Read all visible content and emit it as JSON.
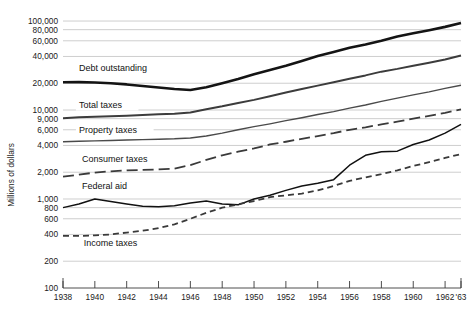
{
  "chart_data": {
    "type": "line",
    "title": "",
    "xlabel": "",
    "ylabel": "Millions of dollars",
    "yscale": "log",
    "ylim": [
      100,
      120000
    ],
    "xlim": [
      1938,
      1963
    ],
    "grid": true,
    "legend_position": "inline-labels",
    "y_ticks": [
      {
        "value": 100,
        "label": "100"
      },
      {
        "value": 200,
        "label": "200"
      },
      {
        "value": 400,
        "label": "400"
      },
      {
        "value": 600,
        "label": "600"
      },
      {
        "value": 800,
        "label": "800"
      },
      {
        "value": 1000,
        "label": "1,000"
      },
      {
        "value": 2000,
        "label": "2,000"
      },
      {
        "value": 4000,
        "label": "4,000"
      },
      {
        "value": 6000,
        "label": "6,000"
      },
      {
        "value": 8000,
        "label": "9,000"
      },
      {
        "value": 10000,
        "label": "10,000"
      },
      {
        "value": 20000,
        "label": "20,000"
      },
      {
        "value": 40000,
        "label": "40,000"
      },
      {
        "value": 60000,
        "label": "60,000"
      },
      {
        "value": 80000,
        "label": "80,000"
      },
      {
        "value": 100000,
        "label": "100,000"
      }
    ],
    "x_ticks": [
      {
        "value": 1938,
        "label": "1938"
      },
      {
        "value": 1940,
        "label": "1940"
      },
      {
        "value": 1942,
        "label": "1942"
      },
      {
        "value": 1944,
        "label": "1944"
      },
      {
        "value": 1946,
        "label": "1946"
      },
      {
        "value": 1948,
        "label": "1948"
      },
      {
        "value": 1950,
        "label": "1950"
      },
      {
        "value": 1952,
        "label": "1952"
      },
      {
        "value": 1954,
        "label": "1954"
      },
      {
        "value": 1956,
        "label": "1956"
      },
      {
        "value": 1958,
        "label": "1958"
      },
      {
        "value": 1960,
        "label": "1960"
      },
      {
        "value": 1962,
        "label": "1962"
      },
      {
        "value": 1963,
        "label": "'63"
      }
    ],
    "x": [
      1938,
      1939,
      1940,
      1941,
      1942,
      1943,
      1944,
      1945,
      1946,
      1947,
      1948,
      1949,
      1950,
      1951,
      1952,
      1953,
      1954,
      1955,
      1956,
      1957,
      1958,
      1959,
      1960,
      1961,
      1962,
      1963
    ],
    "series": [
      {
        "name": "Debt outstanding",
        "label": "Debt outstanding",
        "style": "solid-thick",
        "color": "#141414",
        "width": 2.6,
        "label_x": 1939.0,
        "label_value": 27500,
        "values": [
          20500,
          20600,
          20400,
          20000,
          19400,
          18600,
          17900,
          17200,
          16800,
          18000,
          20000,
          22300,
          25300,
          28200,
          31500,
          35600,
          40400,
          45000,
          50000,
          54500,
          60000,
          67000,
          73000,
          79000,
          86000,
          95000
        ]
      },
      {
        "name": "Total taxes",
        "label": "Total taxes",
        "style": "solid-medium",
        "color": "#3c3c3c",
        "width": 2.0,
        "label_x": 1939.0,
        "label_value": 10800,
        "values": [
          8100,
          8300,
          8400,
          8500,
          8650,
          8800,
          8950,
          9100,
          9400,
          10200,
          11000,
          12000,
          13000,
          14300,
          15700,
          17200,
          18800,
          20500,
          22500,
          24500,
          27000,
          29000,
          31500,
          34000,
          37000,
          41000
        ]
      },
      {
        "name": "Property taxes",
        "label": "Property taxes",
        "style": "solid-thin",
        "color": "#4a4a4a",
        "width": 1.4,
        "label_x": 1939.0,
        "label_value": 5600,
        "values": [
          4400,
          4450,
          4500,
          4550,
          4600,
          4650,
          4700,
          4750,
          4850,
          5100,
          5500,
          6000,
          6500,
          7000,
          7600,
          8200,
          8900,
          9600,
          10500,
          11400,
          12500,
          13600,
          14800,
          16000,
          17500,
          19000
        ]
      },
      {
        "name": "Consumer taxes",
        "label": "Consumer taxes",
        "style": "long-dash",
        "color": "#3a3a3a",
        "width": 1.8,
        "label_x": 1939.2,
        "label_value": 2650,
        "values": [
          1780,
          1880,
          1980,
          2050,
          2100,
          2120,
          2150,
          2200,
          2400,
          2750,
          3100,
          3400,
          3700,
          4100,
          4400,
          4750,
          5100,
          5500,
          6000,
          6400,
          6900,
          7400,
          8000,
          8600,
          9300,
          10200
        ]
      },
      {
        "name": "Federal aid",
        "label": "Federal aid",
        "style": "solid-thin-dark",
        "color": "#111111",
        "width": 1.5,
        "label_x": 1939.2,
        "label_value": 1320,
        "values": [
          800,
          880,
          1000,
          940,
          880,
          830,
          820,
          840,
          900,
          950,
          880,
          860,
          1000,
          1100,
          1250,
          1400,
          1500,
          1650,
          2400,
          3100,
          3400,
          3450,
          4100,
          4600,
          5500,
          6900
        ]
      },
      {
        "name": "Income taxes",
        "label": "Income taxes",
        "style": "short-dash",
        "color": "#3a3a3a",
        "width": 1.8,
        "label_x": 1939.3,
        "label_value": 300,
        "values": [
          385,
          385,
          390,
          400,
          420,
          440,
          470,
          520,
          600,
          700,
          800,
          870,
          950,
          1050,
          1100,
          1150,
          1250,
          1400,
          1600,
          1750,
          1900,
          2100,
          2350,
          2600,
          2900,
          3200
        ]
      }
    ]
  }
}
